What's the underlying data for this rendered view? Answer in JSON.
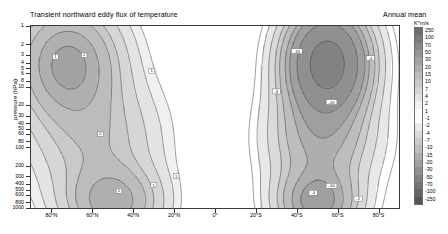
{
  "header": {
    "title": "Transient northward eddy flux of temperature",
    "right_label": "Annual mean"
  },
  "axes": {
    "y_title": "pressure (hPa)",
    "y_ticks": [
      "1",
      "2",
      "3",
      "4",
      "5",
      "6",
      "8",
      "10",
      "20",
      "30",
      "40",
      "50",
      "60",
      "80",
      "100",
      "200",
      "300",
      "400",
      "500",
      "600",
      "800",
      "1000"
    ],
    "x_ticks": [
      "80°N",
      "60°N",
      "40°N",
      "20°N",
      "0°",
      "20°S",
      "40°S",
      "60°S",
      "80°S"
    ]
  },
  "colorbar": {
    "unit": "K*m/s",
    "labels": [
      "250",
      "100",
      "70",
      "50",
      "30",
      "20",
      "15",
      "10",
      "7",
      "4",
      "2",
      "1",
      "-1",
      "-2",
      "-4",
      "-7",
      "-10",
      "-15",
      "-20",
      "-30",
      "-50",
      "-70",
      "-100",
      "-250"
    ],
    "colors": [
      "#6e6e6e",
      "#7b7b7b",
      "#888888",
      "#959595",
      "#a2a2a2",
      "#afafaf",
      "#bcbcbc",
      "#c9c9c9",
      "#d6d6d6",
      "#e3e3e3",
      "#f0f0f0",
      "#ffffff",
      "#ffffff",
      "#e8e8e8",
      "#dadada",
      "#cbcbcb",
      "#bdbdbd",
      "#aeaeae",
      "#9f9f9f",
      "#909090",
      "#828282",
      "#737373",
      "#646464",
      "#555555"
    ]
  },
  "chart_data": {
    "type": "heatmap",
    "title": "Transient northward eddy flux of temperature",
    "subtitle": "Annual mean",
    "xlabel": "latitude",
    "ylabel": "pressure (hPa)",
    "zlabel": "K*m/s",
    "grid": false,
    "legend_position": "right",
    "x": [
      90,
      80,
      60,
      40,
      20,
      0,
      -20,
      -40,
      -60,
      -80,
      -90
    ],
    "xticklabels": [
      "80°N",
      "60°N",
      "40°N",
      "20°N",
      "0°",
      "20°S",
      "40°S",
      "60°S",
      "80°S"
    ],
    "xlim": [
      90,
      -90
    ],
    "ylim": [
      1000,
      1
    ],
    "yscale": "log",
    "yticks": [
      1,
      2,
      3,
      4,
      5,
      6,
      8,
      10,
      20,
      30,
      40,
      50,
      60,
      80,
      100,
      200,
      300,
      400,
      500,
      600,
      800,
      1000
    ],
    "contour_levels": [
      -250,
      -100,
      -70,
      -50,
      -30,
      -20,
      -15,
      -10,
      -7,
      -4,
      -2,
      -1,
      1,
      2,
      4,
      7,
      10,
      15,
      20,
      30,
      50,
      70,
      100,
      250
    ],
    "contour_labels_shown": [
      "1",
      "2",
      "4",
      "10",
      "15",
      "20",
      "-2",
      "-4",
      "-10",
      "-15",
      "-20",
      "-30",
      "-50"
    ],
    "features": [
      {
        "name": "NH stratospheric max",
        "lat": 70,
        "pressure": 5,
        "value": 20
      },
      {
        "name": "NH tropospheric max",
        "lat": 50,
        "pressure": 850,
        "value": 15
      },
      {
        "name": "equatorial minimum",
        "lat": 0,
        "pressure": 100,
        "value": 0
      },
      {
        "name": "SH stratospheric core",
        "lat": 55,
        "pressure": 4,
        "value": -50
      },
      {
        "name": "SH tropospheric max",
        "lat": 50,
        "pressure": 800,
        "value": -20
      }
    ]
  }
}
